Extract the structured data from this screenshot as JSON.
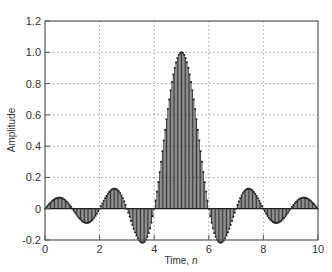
{
  "chart_data": {
    "type": "stem",
    "title": "",
    "xlabel": "Time, ",
    "xlabel_italic": "n",
    "ylabel": "Amplitude",
    "xlim": [
      0,
      10
    ],
    "ylim": [
      -0.2,
      1.2
    ],
    "xticks": [
      "0",
      "2",
      "4",
      "6",
      "8",
      "10"
    ],
    "yticks": [
      "-0.2",
      "0",
      "0.2",
      "0.4",
      "0.6",
      "0.8",
      "1.0",
      "1.2"
    ],
    "grid": true,
    "function": "sinc(t - 5) = sin(pi*(t-5)) / (pi*(t-5))",
    "sample_step": 0.05,
    "peak": {
      "x": 5,
      "y": 1.0
    },
    "zero_crossings": [
      1,
      2,
      3,
      4,
      6,
      7,
      8,
      9
    ],
    "lobes": [
      {
        "x": 2.5,
        "y": 0.127
      },
      {
        "x": 3.5,
        "y": -0.212
      },
      {
        "x": 5.0,
        "y": 1.0
      },
      {
        "x": 6.5,
        "y": -0.212
      },
      {
        "x": 7.5,
        "y": 0.127
      },
      {
        "x": 8.5,
        "y": -0.091
      },
      {
        "x": 1.5,
        "y": -0.091
      }
    ],
    "colors": {
      "stem": "#222222",
      "axis": "#555555",
      "grid": "#888888"
    }
  }
}
